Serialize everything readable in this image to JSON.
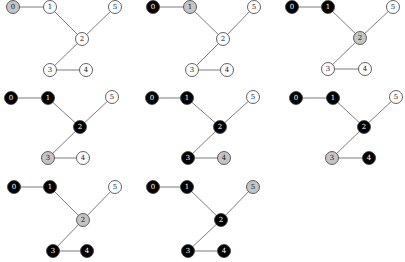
{
  "colors": {
    "visited": "#000000",
    "current": "#c4c4c4",
    "unvisited": "#ffffff",
    "label_on_dark": "#ffffff",
    "label_on_light": "#222222",
    "edge": "#6e6e6e"
  },
  "node_radius": 6.5,
  "graph": {
    "nodes": [
      "0",
      "1",
      "2",
      "3",
      "4",
      "5"
    ],
    "edges": [
      [
        "0",
        "1"
      ],
      [
        "1",
        "2"
      ],
      [
        "2",
        "5"
      ],
      [
        "2",
        "3"
      ],
      [
        "3",
        "4"
      ]
    ]
  },
  "panels": [
    {
      "positions": {
        "0": [
          13,
          7
        ],
        "1": [
          50,
          7
        ],
        "2": [
          82,
          39
        ],
        "3": [
          50,
          70
        ],
        "4": [
          86,
          70
        ],
        "5": [
          115,
          7
        ]
      },
      "states": {
        "0": "current",
        "1": "unvisited",
        "2": "unvisited",
        "3": "unvisited",
        "4": "unvisited",
        "5": "unvisited"
      }
    },
    {
      "positions": {
        "0": [
          153,
          7
        ],
        "1": [
          190,
          7
        ],
        "2": [
          223,
          39
        ],
        "3": [
          192,
          70
        ],
        "4": [
          227,
          70
        ],
        "5": [
          254,
          7
        ]
      },
      "states": {
        "0": "visited",
        "1": "current",
        "2": "unvisited",
        "3": "unvisited",
        "4": "unvisited",
        "5": "unvisited"
      }
    },
    {
      "positions": {
        "0": [
          292,
          7
        ],
        "1": [
          328,
          7
        ],
        "2": [
          360,
          38
        ],
        "3": [
          328,
          69
        ],
        "4": [
          365,
          69
        ],
        "5": [
          393,
          7
        ]
      },
      "states": {
        "0": "visited",
        "1": "visited",
        "2": "current",
        "3": "unvisited",
        "4": "unvisited",
        "5": "unvisited"
      }
    },
    {
      "positions": {
        "0": [
          11,
          98
        ],
        "1": [
          48,
          98
        ],
        "2": [
          80,
          127
        ],
        "3": [
          48,
          158
        ],
        "4": [
          83,
          158
        ],
        "5": [
          112,
          97
        ]
      },
      "states": {
        "0": "visited",
        "1": "visited",
        "2": "visited",
        "3": "current",
        "4": "unvisited",
        "5": "unvisited"
      }
    },
    {
      "positions": {
        "0": [
          152,
          98
        ],
        "1": [
          187,
          98
        ],
        "2": [
          220,
          127
        ],
        "3": [
          188,
          158
        ],
        "4": [
          224,
          158
        ],
        "5": [
          253,
          97
        ]
      },
      "states": {
        "0": "visited",
        "1": "visited",
        "2": "visited",
        "3": "visited",
        "4": "current",
        "5": "unvisited"
      }
    },
    {
      "positions": {
        "0": [
          296,
          98
        ],
        "1": [
          333,
          98
        ],
        "2": [
          364,
          127
        ],
        "3": [
          332,
          158
        ],
        "4": [
          369,
          158
        ],
        "5": [
          396,
          97
        ]
      },
      "states": {
        "0": "visited",
        "1": "visited",
        "2": "visited",
        "3": "current",
        "4": "visited",
        "5": "unvisited"
      }
    },
    {
      "positions": {
        "0": [
          14,
          187
        ],
        "1": [
          50,
          187
        ],
        "2": [
          83,
          220
        ],
        "3": [
          53,
          251
        ],
        "4": [
          87,
          251
        ],
        "5": [
          115,
          187
        ]
      },
      "states": {
        "0": "visited",
        "1": "visited",
        "2": "current",
        "3": "visited",
        "4": "visited",
        "5": "unvisited"
      }
    },
    {
      "positions": {
        "0": [
          153,
          187
        ],
        "1": [
          187,
          187
        ],
        "2": [
          221,
          220
        ],
        "3": [
          188,
          251
        ],
        "4": [
          224,
          251
        ],
        "5": [
          253,
          187
        ]
      },
      "states": {
        "0": "visited",
        "1": "visited",
        "2": "visited",
        "3": "visited",
        "4": "visited",
        "5": "current"
      }
    }
  ]
}
